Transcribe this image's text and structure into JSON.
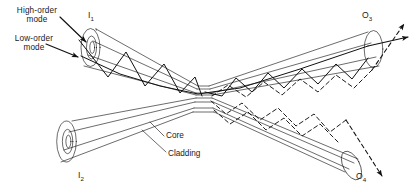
{
  "figure": {
    "kind": "optical-fiber-coupler-diagram",
    "stroke_color": "#111111",
    "background_color": "#ffffff"
  },
  "labels": {
    "high_order_mode": "High-order\nmode",
    "high_order_mode_line1": "High-order",
    "high_order_mode_line2": "mode",
    "low_order_mode_line1": "Low-order",
    "low_order_mode_line2": "mode",
    "input_1": "I",
    "input_1_sub": "1",
    "input_2": "I",
    "input_2_sub": "2",
    "output_3": "O",
    "output_3_sub": "3",
    "output_4": "O",
    "output_4_sub": "4",
    "core": "Core",
    "cladding": "Cladding"
  },
  "ports": [
    {
      "id": "I1",
      "role": "input",
      "position": "upper-left"
    },
    {
      "id": "I2",
      "role": "input",
      "position": "lower-left"
    },
    {
      "id": "O3",
      "role": "output",
      "position": "upper-right"
    },
    {
      "id": "O4",
      "role": "output",
      "position": "lower-right"
    }
  ],
  "rays": [
    {
      "name": "high-order-mode",
      "style": "solid",
      "entry": "I1",
      "exits": [
        "O3"
      ]
    },
    {
      "name": "low-order-mode",
      "style": "solid",
      "entry": "I1",
      "exits": [
        "O3"
      ]
    },
    {
      "name": "coupled-mode",
      "style": "dashed",
      "entry": "I1",
      "exits": [
        "O3",
        "O4"
      ]
    }
  ],
  "parts": [
    {
      "name": "core",
      "leader": true
    },
    {
      "name": "cladding",
      "leader": true
    }
  ]
}
